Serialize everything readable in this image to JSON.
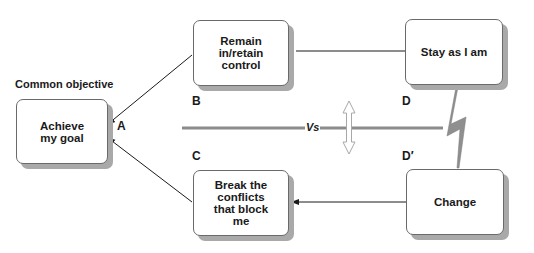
{
  "diagram": {
    "type": "conflict-cloud",
    "heading": "Common objective",
    "boxes": {
      "A": {
        "text": "Achieve\nmy goal",
        "letter": "A"
      },
      "B": {
        "text": "Remain\nin/retain\ncontrol",
        "letter": "B"
      },
      "C": {
        "text": "Break the\nconflicts\nthat block\nme",
        "letter": "C"
      },
      "D": {
        "text": "Stay as I am",
        "letter": "D"
      },
      "Dprime": {
        "text": "Change",
        "letter": "D′"
      }
    },
    "separator_label": "Vs",
    "connections": [
      {
        "from": "B",
        "to": "A",
        "arrow": true
      },
      {
        "from": "C",
        "to": "A",
        "arrow": true
      },
      {
        "from": "D",
        "to": "B",
        "arrow": false
      },
      {
        "from": "Dprime",
        "to": "C",
        "arrow": true
      },
      {
        "from": "D",
        "to": "Dprime",
        "style": "lightning-conflict"
      }
    ],
    "colors": {
      "line": "#1a1a1a",
      "separator": "#8c8c8c",
      "shadow": "#a9a9a9",
      "lightning": "#8f8f8f"
    }
  }
}
